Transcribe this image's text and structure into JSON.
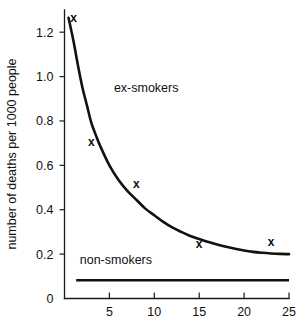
{
  "chart_data": {
    "type": "line",
    "title": "",
    "subtitle": "",
    "xlabel": "",
    "ylabel": "number of deaths per 1000 people",
    "xlim": [
      0,
      25
    ],
    "ylim": [
      0,
      1.3
    ],
    "grid": false,
    "legend_position": "inline-annotation",
    "x_ticks": [
      {
        "value": 5,
        "label": "5"
      },
      {
        "value": 10,
        "label": "10"
      },
      {
        "value": 15,
        "label": "15"
      },
      {
        "value": 20,
        "label": "20"
      },
      {
        "value": 25,
        "label": "25"
      }
    ],
    "y_ticks": [
      {
        "value": 0,
        "label": "0"
      },
      {
        "value": 0.2,
        "label": "0.2"
      },
      {
        "value": 0.4,
        "label": "0.4"
      },
      {
        "value": 0.6,
        "label": "0.6"
      },
      {
        "value": 0.8,
        "label": "0.8"
      },
      {
        "value": 1.0,
        "label": "1.0"
      },
      {
        "value": 1.2,
        "label": "1.2"
      }
    ],
    "series": [
      {
        "name": "ex-smokers",
        "label": "ex-smokers",
        "label_x": 5.5,
        "label_y": 0.93,
        "marker": "x",
        "color": "#111111",
        "asymptote": 0.2,
        "points": [
          {
            "x": 1.0,
            "y": 1.23
          },
          {
            "x": 3.0,
            "y": 0.67
          },
          {
            "x": 8.0,
            "y": 0.48
          },
          {
            "x": 15.0,
            "y": 0.21
          },
          {
            "x": 23.0,
            "y": 0.22
          }
        ],
        "curve": [
          {
            "x": 0.45,
            "y": 1.265
          },
          {
            "x": 1.0,
            "y": 1.16
          },
          {
            "x": 1.5,
            "y": 1.05
          },
          {
            "x": 2.0,
            "y": 0.95
          },
          {
            "x": 2.5,
            "y": 0.87
          },
          {
            "x": 3.0,
            "y": 0.79
          },
          {
            "x": 3.5,
            "y": 0.735
          },
          {
            "x": 4.0,
            "y": 0.685
          },
          {
            "x": 5.0,
            "y": 0.6
          },
          {
            "x": 6.0,
            "y": 0.535
          },
          {
            "x": 7.0,
            "y": 0.485
          },
          {
            "x": 8.0,
            "y": 0.445
          },
          {
            "x": 9.0,
            "y": 0.405
          },
          {
            "x": 10.0,
            "y": 0.375
          },
          {
            "x": 11.0,
            "y": 0.345
          },
          {
            "x": 12.0,
            "y": 0.32
          },
          {
            "x": 13.0,
            "y": 0.3
          },
          {
            "x": 14.0,
            "y": 0.282
          },
          {
            "x": 15.0,
            "y": 0.268
          },
          {
            "x": 16.0,
            "y": 0.255
          },
          {
            "x": 17.0,
            "y": 0.243
          },
          {
            "x": 18.0,
            "y": 0.233
          },
          {
            "x": 19.0,
            "y": 0.224
          },
          {
            "x": 20.0,
            "y": 0.216
          },
          {
            "x": 21.0,
            "y": 0.21
          },
          {
            "x": 22.0,
            "y": 0.206
          },
          {
            "x": 23.0,
            "y": 0.203
          },
          {
            "x": 24.0,
            "y": 0.201
          },
          {
            "x": 25.0,
            "y": 0.2
          }
        ]
      },
      {
        "name": "non-smokers",
        "label": "non-smokers",
        "label_x": 1.7,
        "label_y": 0.155,
        "marker": "none",
        "color": "#111111",
        "constant_value": 0.082,
        "x_start": 1.3,
        "x_end": 25.0
      }
    ]
  }
}
